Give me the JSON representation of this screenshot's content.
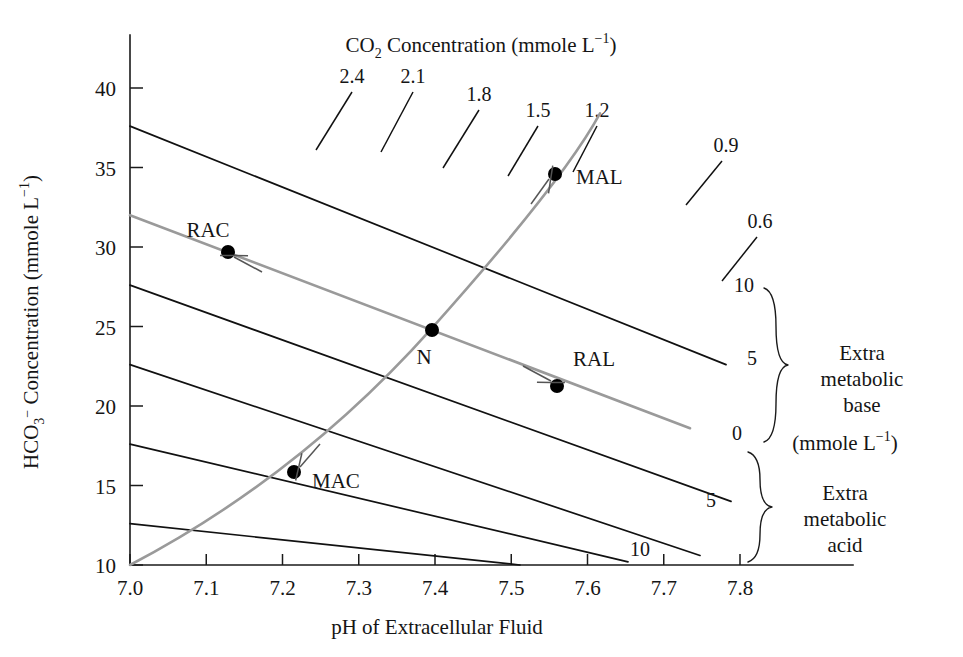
{
  "chart_data": {
    "type": "line",
    "title_parts": {
      "pre": "CO",
      "sub": "2",
      "post": " Concentration (mmole L",
      "sup": "−1",
      "tail": ")"
    },
    "xlabel": "pH of Extracellular Fluid",
    "ylabel_parts": {
      "pre": "HCO",
      "sub": "3",
      "sup": "−",
      "post": " Concentration (mmole L",
      "sup2": "−1",
      "tail": ")"
    },
    "ylabel": "HCO3- Concentration (mmole L-1)",
    "xlim": [
      6.97,
      7.85
    ],
    "ylim": [
      9.2,
      42.0
    ],
    "xticks": [
      "7.0",
      "7.1",
      "7.2",
      "7.3",
      "7.4",
      "7.5",
      "7.6",
      "7.7",
      "7.8"
    ],
    "xtick_values": [
      7.0,
      7.1,
      7.2,
      7.3,
      7.4,
      7.5,
      7.6,
      7.7,
      7.8
    ],
    "yticks": [
      "10",
      "15",
      "20",
      "25",
      "30",
      "35",
      "40"
    ],
    "ytick_values": [
      10,
      15,
      20,
      25,
      30,
      35,
      40
    ],
    "grid": false,
    "legend": "none",
    "co2_isopleths": {
      "label": "CO2 Concentration (mmole L-1)",
      "units": "mmole L-1",
      "values": [
        2.4,
        2.1,
        1.8,
        1.5,
        1.2,
        0.9,
        0.6
      ],
      "label_positions": [
        {
          "value": "2.4",
          "x": 352,
          "y": 83
        },
        {
          "value": "2.1",
          "x": 413,
          "y": 83
        },
        {
          "value": "1.8",
          "x": 479,
          "y": 101
        },
        {
          "value": "1.5",
          "x": 538,
          "y": 117
        },
        {
          "value": "1.2",
          "x": 597,
          "y": 117
        },
        {
          "value": "0.9",
          "x": 726,
          "y": 152
        },
        {
          "value": "0.6",
          "x": 760,
          "y": 228
        }
      ]
    },
    "metabolic_lines": {
      "title_upper": "Extra metabolic base",
      "title_lower": "Extra metabolic acid",
      "units": "(mmole L-1)",
      "labels": [
        {
          "text": "10",
          "x": 744,
          "y": 292
        },
        {
          "text": "5",
          "x": 752,
          "y": 365
        },
        {
          "text": "0",
          "x": 737,
          "y": 440
        },
        {
          "text": "5",
          "x": 711,
          "y": 507
        },
        {
          "text": "10",
          "x": 640,
          "y": 556
        }
      ]
    },
    "points": [
      {
        "name": "RAC",
        "label": "RAC",
        "ph": 7.125,
        "hco3": 29.7,
        "px": 228,
        "py": 252,
        "label_x": 208,
        "label_y": 237,
        "arrow": "from-lower-right"
      },
      {
        "name": "MAL",
        "label": "MAL",
        "ph": 7.545,
        "hco3": 34.6,
        "px": 555,
        "py": 174,
        "label_x": 576,
        "label_y": 184,
        "arrow": "from-lower-left"
      },
      {
        "name": "N",
        "label": "N",
        "ph": 7.38,
        "hco3": 24.9,
        "px": 432,
        "py": 330,
        "label_x": 424,
        "label_y": 364,
        "arrow": "none"
      },
      {
        "name": "RAL",
        "label": "RAL",
        "ph": 7.555,
        "hco3": 21.4,
        "px": 557,
        "py": 386,
        "label_x": 573,
        "label_y": 366,
        "arrow": "from-upper-left"
      },
      {
        "name": "MAC",
        "label": "MAC",
        "ph": 7.205,
        "hco3": 15.8,
        "px": 294,
        "py": 472,
        "label_x": 312,
        "label_y": 488,
        "arrow": "from-upper-right"
      }
    ],
    "annotations": [
      {
        "id": "extra-metabolic-base",
        "lines": [
          "Extra",
          "metabolic",
          "base"
        ],
        "x": 862,
        "y": 360
      },
      {
        "id": "metabolic-units",
        "lines": [
          "(mmole L-1)"
        ],
        "x": 845,
        "y": 450
      },
      {
        "id": "extra-metabolic-acid",
        "lines": [
          "Extra",
          "metabolic",
          "acid"
        ],
        "x": 845,
        "y": 500
      }
    ]
  },
  "colors": {
    "ink": "#151515",
    "curve": "#111111",
    "buffer_line": "#9a9a9a",
    "background": "#ffffff"
  }
}
